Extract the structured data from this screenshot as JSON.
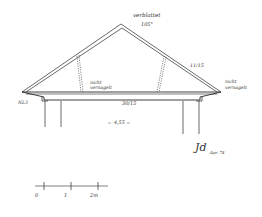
{
  "drawing": {
    "type": "roof-truss-section",
    "annotations": {
      "apex_joint": "verblattet",
      "apex_angle": "105°",
      "rafter_size": "11/15",
      "left_strut": "nicht",
      "left_strut_2": "vernagelt",
      "right_eave": "nicht",
      "right_eave_2": "vernagelt",
      "left_eave_label": "NL3",
      "tie_beam_size": "30/15",
      "span": "4,55",
      "signature": "Jd",
      "signature_date": "Apr. 74"
    },
    "scale_bar": {
      "ticks": [
        "0",
        "1",
        "2m"
      ]
    }
  }
}
